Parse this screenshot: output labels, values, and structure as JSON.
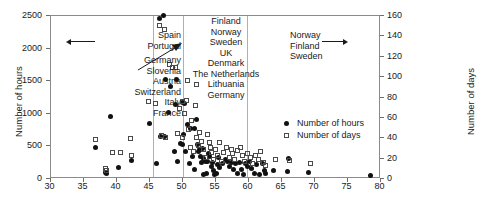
{
  "chart_data": {
    "type": "scatter",
    "title": "",
    "xlabel": "",
    "ylabel": "Number of hours",
    "y2label": "Number of days",
    "xlim": [
      30,
      80
    ],
    "ylim": [
      0,
      2500
    ],
    "y2lim": [
      0,
      160
    ],
    "xticks": [
      30,
      35,
      40,
      45,
      50,
      55,
      60,
      65,
      70,
      75,
      80
    ],
    "yticks": [
      0,
      500,
      1000,
      1500,
      2000,
      2500
    ],
    "y2ticks": [
      0,
      20,
      40,
      60,
      80,
      100,
      120,
      140,
      160
    ],
    "grid": false,
    "legend_position": "center-right",
    "legend": [
      {
        "key": "hours",
        "label": "Number of hours",
        "marker": "filled-circle"
      },
      {
        "key": "days",
        "label": "Number of days",
        "marker": "open-square"
      }
    ],
    "reference_lines": [
      {
        "axis": "x",
        "value": 45.5
      },
      {
        "axis": "x",
        "value": 50.0
      },
      {
        "axis": "x",
        "value": 59.8
      }
    ],
    "annotations": [
      {
        "id": "spain-portugal",
        "lines": [
          "Spain",
          "Portugal"
        ],
        "align": "right",
        "arrow": "left",
        "x": 41.0,
        "y": 2000
      },
      {
        "id": "germany-group",
        "lines": [
          "Germany",
          "Slovenia",
          "Austria",
          "Switzerland",
          "Italy",
          "France"
        ],
        "align": "right",
        "arrow": "diagonal-up-right",
        "x": 41.0,
        "y": 1550
      },
      {
        "id": "nordic-uk-group",
        "lines": [
          "Finland",
          "Norway",
          "Sweden",
          "UK",
          "Denmark",
          "The Netherlands",
          "Lithuania",
          "Germany"
        ],
        "align": "center",
        "arrow": "none",
        "x": 53.0,
        "y": 2300
      },
      {
        "id": "nordic-group",
        "lines": [
          "Norway",
          "Finland",
          "Sweden"
        ],
        "align": "left",
        "arrow": "right",
        "x": 61.5,
        "y": 2200
      }
    ],
    "series": [
      {
        "name": "Number of hours",
        "marker": "filled-circle",
        "axis": "left",
        "points": [
          [
            37.0,
            470
          ],
          [
            38.5,
            90
          ],
          [
            38.6,
            70
          ],
          [
            39.3,
            940
          ],
          [
            40.5,
            160
          ],
          [
            42.4,
            270
          ],
          [
            45.2,
            840
          ],
          [
            46.2,
            225
          ],
          [
            46.6,
            2440
          ],
          [
            47.3,
            2490
          ],
          [
            46.8,
            640
          ],
          [
            47.4,
            640
          ],
          [
            47.6,
            1510
          ],
          [
            48.1,
            1000
          ],
          [
            48.4,
            1400
          ],
          [
            49.2,
            1510
          ],
          [
            49.1,
            1130
          ],
          [
            48.9,
            400
          ],
          [
            49.4,
            250
          ],
          [
            49.8,
            530
          ],
          [
            50.1,
            1160
          ],
          [
            50.2,
            520
          ],
          [
            50.4,
            1140
          ],
          [
            50.3,
            660
          ],
          [
            50.6,
            400
          ],
          [
            50.9,
            820
          ],
          [
            51.2,
            230
          ],
          [
            51.4,
            760
          ],
          [
            51.6,
            330
          ],
          [
            51.9,
            130
          ],
          [
            52.2,
            900
          ],
          [
            52.0,
            760
          ],
          [
            52.4,
            520
          ],
          [
            52.5,
            400
          ],
          [
            52.7,
            430
          ],
          [
            52.9,
            330
          ],
          [
            53.0,
            240
          ],
          [
            53.2,
            460
          ],
          [
            53.4,
            300
          ],
          [
            53.6,
            250
          ],
          [
            53.3,
            60
          ],
          [
            53.8,
            70
          ],
          [
            54.1,
            380
          ],
          [
            54.3,
            330
          ],
          [
            54.0,
            260
          ],
          [
            54.5,
            180
          ],
          [
            54.7,
            240
          ],
          [
            54.9,
            120
          ],
          [
            55.0,
            60
          ],
          [
            55.3,
            70
          ],
          [
            55.4,
            200
          ],
          [
            55.6,
            310
          ],
          [
            55.8,
            160
          ],
          [
            56.2,
            230
          ],
          [
            56.6,
            280
          ],
          [
            57.0,
            250
          ],
          [
            57.3,
            180
          ],
          [
            57.6,
            240
          ],
          [
            57.9,
            130
          ],
          [
            58.2,
            220
          ],
          [
            58.5,
            70
          ],
          [
            58.8,
            240
          ],
          [
            59.1,
            130
          ],
          [
            59.4,
            60
          ],
          [
            59.7,
            230
          ],
          [
            60.0,
            170
          ],
          [
            60.3,
            250
          ],
          [
            60.6,
            150
          ],
          [
            61.0,
            70
          ],
          [
            61.4,
            210
          ],
          [
            61.8,
            60
          ],
          [
            62.2,
            230
          ],
          [
            62.5,
            120
          ],
          [
            62.8,
            70
          ],
          [
            64.0,
            110
          ],
          [
            66.0,
            100
          ],
          [
            66.2,
            300
          ],
          [
            69.3,
            90
          ],
          [
            78.7,
            40
          ]
        ]
      },
      {
        "name": "Number of days",
        "marker": "open-square",
        "axis": "right",
        "points": [
          [
            37.0,
            38
          ],
          [
            38.5,
            9
          ],
          [
            38.6,
            7
          ],
          [
            39.6,
            25
          ],
          [
            40.8,
            25
          ],
          [
            42.3,
            39
          ],
          [
            42.4,
            22
          ],
          [
            45.0,
            75
          ],
          [
            46.0,
            73
          ],
          [
            46.7,
            150
          ],
          [
            47.4,
            146
          ],
          [
            47.0,
            42
          ],
          [
            47.6,
            40
          ],
          [
            48.2,
            111
          ],
          [
            48.6,
            108
          ],
          [
            49.1,
            108
          ],
          [
            49.4,
            44
          ],
          [
            49.7,
            68
          ],
          [
            50.2,
            75
          ],
          [
            50.4,
            63
          ],
          [
            50.7,
            76
          ],
          [
            50.1,
            40
          ],
          [
            51.0,
            48
          ],
          [
            51.3,
            30
          ],
          [
            51.5,
            56
          ],
          [
            51.8,
            26
          ],
          [
            52.1,
            71
          ],
          [
            52.3,
            40
          ],
          [
            52.6,
            32
          ],
          [
            52.8,
            45
          ],
          [
            53.1,
            36
          ],
          [
            53.4,
            28
          ],
          [
            53.6,
            20
          ],
          [
            53.9,
            43
          ],
          [
            54.2,
            35
          ],
          [
            54.4,
            30
          ],
          [
            54.6,
            25
          ],
          [
            54.9,
            18
          ],
          [
            55.2,
            28
          ],
          [
            55.5,
            22
          ],
          [
            55.8,
            35
          ],
          [
            56.0,
            16
          ],
          [
            56.4,
            25
          ],
          [
            56.8,
            30
          ],
          [
            57.2,
            20
          ],
          [
            57.5,
            28
          ],
          [
            57.8,
            24
          ],
          [
            58.1,
            18
          ],
          [
            58.5,
            27
          ],
          [
            58.9,
            30
          ],
          [
            59.3,
            22
          ],
          [
            59.6,
            16
          ],
          [
            60.0,
            24
          ],
          [
            60.4,
            20
          ],
          [
            60.8,
            14
          ],
          [
            61.2,
            22
          ],
          [
            61.6,
            18
          ],
          [
            62.0,
            26
          ],
          [
            62.4,
            15
          ],
          [
            62.8,
            12
          ],
          [
            64.2,
            18
          ],
          [
            66.3,
            17
          ],
          [
            69.5,
            14
          ],
          [
            50.9,
            96
          ],
          [
            52.2,
            92
          ]
        ]
      }
    ]
  }
}
